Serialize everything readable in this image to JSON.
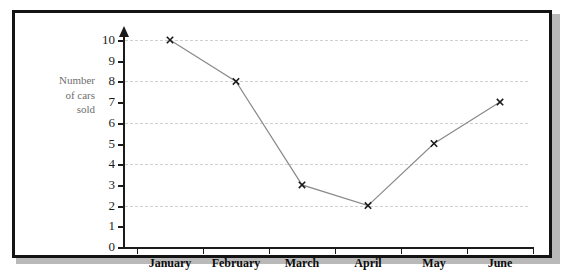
{
  "chart_data": {
    "type": "line",
    "title": "",
    "xlabel": "",
    "ylabel": "Number of cars sold",
    "ylabel_lines": [
      "Number",
      "of cars",
      "sold"
    ],
    "categories": [
      "January",
      "February",
      "March",
      "April",
      "May",
      "June"
    ],
    "values": [
      10,
      8,
      3,
      2,
      5,
      7
    ],
    "series": [
      {
        "name": "Cars sold",
        "values": [
          10,
          8,
          3,
          2,
          5,
          7
        ]
      }
    ],
    "points": [
      {
        "category": "January",
        "value": 10
      },
      {
        "category": "February",
        "value": 8
      },
      {
        "category": "March",
        "value": 3
      },
      {
        "category": "April",
        "value": 2
      },
      {
        "category": "May",
        "value": 5
      },
      {
        "category": "June",
        "value": 7
      }
    ],
    "ylim": [
      0,
      10
    ],
    "yticks": [
      0,
      1,
      2,
      3,
      4,
      5,
      6,
      7,
      8,
      9,
      10
    ],
    "ytick_labels": [
      "0",
      "1",
      "2",
      "3",
      "4",
      "5",
      "6",
      "7",
      "8",
      "9",
      "10"
    ],
    "gridlines_at": [
      2,
      4,
      6,
      8,
      10
    ],
    "grid": true,
    "grid_style": "dotted",
    "legend": "none",
    "marker": "x-cross",
    "line_color": "#8a8a8a",
    "marker_color": "#1b1b1b",
    "grid_color": "#d3cfcb",
    "axis_color": "#1b1b1b",
    "ylabel_color": "#6f6f6f",
    "frame_color": "#141414",
    "background": "#ffffff"
  }
}
